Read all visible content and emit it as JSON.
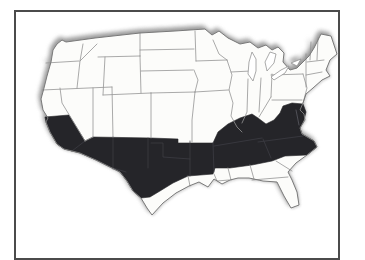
{
  "figure": {
    "type": "us-map",
    "colors": {
      "background": "#ffffff",
      "frame": "#4b4b4b",
      "state_fill": "#fcfcfa",
      "state_border": "#949494",
      "outline": "#7a7a7a",
      "highlight_fill": "#252529",
      "faint_line": "#3f3f46"
    },
    "highlighted_areas": [
      "Southern California",
      "Arizona",
      "New Mexico",
      "Oklahoma",
      "Northern Texas",
      "Arkansas",
      "Tennessee",
      "Kentucky",
      "Virginia",
      "Maryland",
      "North Carolina"
    ],
    "unshaded_examples": [
      "Washington",
      "Oregon",
      "Nevada",
      "Utah",
      "Colorado",
      "Kansas",
      "Missouri",
      "West Virginia",
      "South Carolina",
      "Georgia",
      "Alabama",
      "Mississippi",
      "Louisiana",
      "Southern Texas",
      "Florida",
      "Great Lakes states",
      "New England"
    ]
  }
}
